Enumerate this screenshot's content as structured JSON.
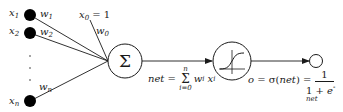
{
  "diagram": {
    "colors": {
      "stroke": "#1a1a1a",
      "node_fill": "#000000",
      "background": "#ffffff"
    },
    "inputs": [
      {
        "id": "x1",
        "label": "x",
        "sub": "1",
        "weight": "w",
        "weight_sub": "1"
      },
      {
        "id": "x2",
        "label": "x",
        "sub": "2",
        "weight": "w",
        "weight_sub": "2"
      },
      {
        "id": "xn",
        "label": "x",
        "sub": "n",
        "weight": "w",
        "weight_sub": "n"
      }
    ],
    "ellipsis": "· · ·",
    "bias": {
      "label": "x",
      "sub": "0",
      "eq": " = 1",
      "weight": "w",
      "weight_sub": "0"
    },
    "sum_node": {
      "symbol": "Σ"
    },
    "net_equation": {
      "lhs": "net",
      "eq": " = ",
      "sum_top": "n",
      "sum_symbol": "Σ",
      "sum_bottom": "i=0",
      "term_w": "w",
      "term_w_sub": "i",
      "term_x": "x",
      "term_x_sub": "i"
    },
    "activation_node": {
      "type": "sigmoid-icon"
    },
    "output_equation": {
      "lhs": "o",
      "eq1": " = σ(",
      "arg": "net",
      "eq2": ") = ",
      "numerator": "1",
      "denominator_pre": "1 + ",
      "denominator_base": "e",
      "denominator_exp": "-net"
    }
  }
}
